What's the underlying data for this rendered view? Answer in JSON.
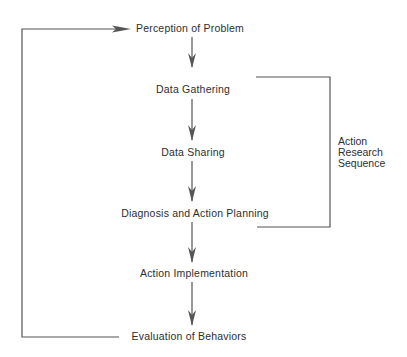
{
  "diagram": {
    "nodes": [
      {
        "id": "perception",
        "label": "Perception of Problem",
        "x": 190,
        "y": 28
      },
      {
        "id": "data-gathering",
        "label": "Data Gathering",
        "x": 193,
        "y": 89
      },
      {
        "id": "data-sharing",
        "label": "Data Sharing",
        "x": 193,
        "y": 152
      },
      {
        "id": "diagnosis",
        "label": "Diagnosis and Action Planning",
        "x": 195,
        "y": 213
      },
      {
        "id": "implementation",
        "label": "Action Implementation",
        "x": 194,
        "y": 273
      },
      {
        "id": "evaluation",
        "label": "Evaluation of Behaviors",
        "x": 189,
        "y": 336
      }
    ],
    "bracket_label": {
      "lines": [
        "Action",
        "Research",
        "Sequence"
      ]
    },
    "colors": {
      "line": "#555555",
      "text": "#2e2e2e",
      "background": "#ffffff"
    }
  }
}
